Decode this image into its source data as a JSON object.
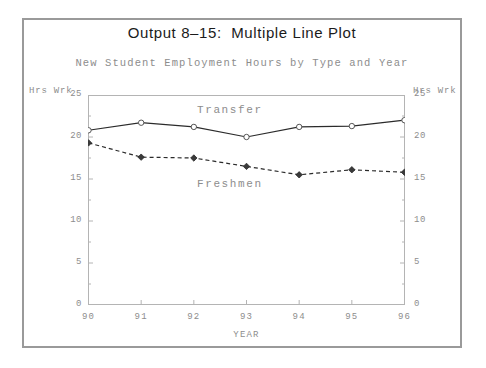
{
  "title": "Output 8–15:  Multiple Line Plot",
  "subtitle": "New Student Employment Hours by Type and Year",
  "axes": {
    "left_caption": "Hrs Wrk",
    "right_caption": "Hrs Wrk",
    "x_title": "YEAR",
    "y_ticks": [
      "25",
      "20",
      "15",
      "10",
      "5",
      "0"
    ],
    "x_ticks": [
      "90",
      "91",
      "92",
      "93",
      "94",
      "95",
      "96"
    ]
  },
  "series_labels": {
    "transfer": "Transfer",
    "freshmen": "Freshmen"
  },
  "colors": {
    "frame": "#9a9a9a",
    "axis": "#b4b4b4",
    "tick_text": "#8d8d8d",
    "title_text": "#1b1b1b",
    "transfer_line": "#2b2b2b",
    "freshmen_line": "#2b2b2b",
    "marker_fill": "#ffffff",
    "background": "#ffffff"
  },
  "chart_data": {
    "type": "line",
    "title": "Output 8–15:  Multiple Line Plot",
    "subtitle": "New Student Employment Hours by Type and Year",
    "xlabel": "YEAR",
    "ylabel": "Hrs Wrk",
    "x": [
      90,
      91,
      92,
      93,
      94,
      95,
      96
    ],
    "xtick_labels": [
      "90",
      "91",
      "92",
      "93",
      "94",
      "95",
      "96"
    ],
    "ylim": [
      0,
      25
    ],
    "yticks": [
      0,
      5,
      10,
      15,
      20,
      25
    ],
    "grid": false,
    "legend": "inline-labels",
    "series": [
      {
        "name": "Transfer",
        "values": [
          20.8,
          21.7,
          21.2,
          20.0,
          21.2,
          21.3,
          22.0
        ],
        "line_style": "solid",
        "marker": "circle"
      },
      {
        "name": "Freshmen",
        "values": [
          19.3,
          17.6,
          17.5,
          16.5,
          15.5,
          16.1,
          15.8
        ],
        "line_style": "dashed",
        "marker": "diamond"
      }
    ]
  }
}
